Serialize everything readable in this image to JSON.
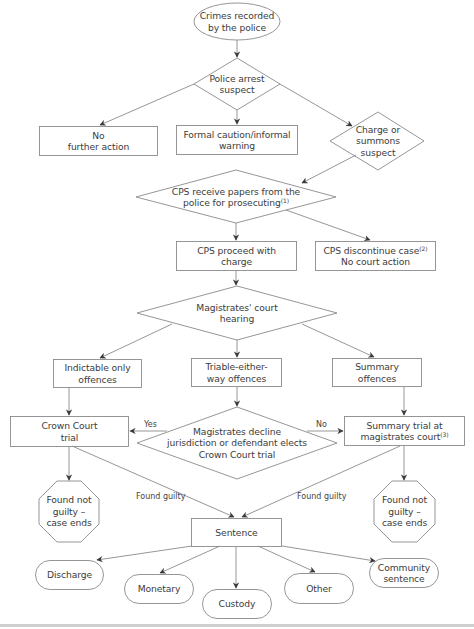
{
  "diagram": {
    "type": "flowchart",
    "stroke_color": "#8a8a8a",
    "arrow_color": "#3a3a3a",
    "nodes": {
      "crimes_recorded": {
        "shape": "ellipse",
        "text": "Crimes recorded\nby the police"
      },
      "police_arrest": {
        "shape": "diamond",
        "text": "Police arrest\nsuspect"
      },
      "no_further_action": {
        "shape": "rectangle",
        "text": "No\nfurther action"
      },
      "formal_caution": {
        "shape": "rectangle",
        "text": "Formal caution/informal\nwarning"
      },
      "charge_or_summons": {
        "shape": "diamond",
        "text": "Charge or\nsummons\nsuspect"
      },
      "cps_receive": {
        "shape": "diamond",
        "text": "CPS receive papers from the\npolice for prosecuting",
        "footnote": "(1)"
      },
      "cps_proceed": {
        "shape": "rectangle",
        "text": "CPS proceed with\ncharge"
      },
      "cps_discontinue": {
        "shape": "rectangle",
        "text_line1": "CPS discontinue case",
        "footnote": "(2)",
        "text_line2": "No court action"
      },
      "magistrates_hearing": {
        "shape": "diamond",
        "text": "Magistrates' court\nhearing"
      },
      "indictable_only": {
        "shape": "rectangle",
        "text": "Indictable only\noffences"
      },
      "triable_either_way": {
        "shape": "rectangle",
        "text": "Triable-either-\nway offences"
      },
      "summary_offences": {
        "shape": "rectangle",
        "text": "Summary\noffences"
      },
      "crown_court_trial": {
        "shape": "rectangle",
        "text": "Crown Court\ntrial"
      },
      "magistrates_decline": {
        "shape": "diamond",
        "text": "Magistrates decline\njurisdiction or defendant elects\nCrown Court trial"
      },
      "summary_trial": {
        "shape": "rectangle",
        "text_line1": "Summary trial at",
        "text_line2": "magistrates court",
        "footnote": "(3)"
      },
      "not_guilty_left": {
        "shape": "octagon",
        "text": "Found not\nguilty –\ncase ends"
      },
      "not_guilty_right": {
        "shape": "octagon",
        "text": "Found not\nguilty –\ncase ends"
      },
      "sentence": {
        "shape": "rectangle",
        "text": "Sentence"
      },
      "discharge": {
        "shape": "rounded",
        "text": "Discharge"
      },
      "monetary": {
        "shape": "rounded",
        "text": "Monetary"
      },
      "custody": {
        "shape": "rounded",
        "text": "Custody"
      },
      "other": {
        "shape": "rounded",
        "text": "Other"
      },
      "community_sentence": {
        "shape": "rounded",
        "text": "Community\nsentence"
      }
    },
    "edge_labels": {
      "yes": "Yes",
      "no": "No",
      "found_guilty_left": "Found guilty",
      "found_guilty_right": "Found guilty"
    },
    "edges": [
      [
        "crimes_recorded",
        "police_arrest"
      ],
      [
        "police_arrest",
        "no_further_action"
      ],
      [
        "police_arrest",
        "formal_caution"
      ],
      [
        "police_arrest",
        "charge_or_summons"
      ],
      [
        "charge_or_summons",
        "cps_receive"
      ],
      [
        "cps_receive",
        "cps_proceed"
      ],
      [
        "cps_receive",
        "cps_discontinue"
      ],
      [
        "cps_proceed",
        "magistrates_hearing"
      ],
      [
        "magistrates_hearing",
        "indictable_only"
      ],
      [
        "magistrates_hearing",
        "triable_either_way"
      ],
      [
        "magistrates_hearing",
        "summary_offences"
      ],
      [
        "indictable_only",
        "crown_court_trial"
      ],
      [
        "triable_either_way",
        "magistrates_decline"
      ],
      [
        "summary_offences",
        "summary_trial"
      ],
      [
        "magistrates_decline",
        "crown_court_trial",
        "Yes"
      ],
      [
        "magistrates_decline",
        "summary_trial",
        "No"
      ],
      [
        "crown_court_trial",
        "not_guilty_left"
      ],
      [
        "summary_trial",
        "not_guilty_right"
      ],
      [
        "crown_court_trial",
        "sentence",
        "Found guilty"
      ],
      [
        "summary_trial",
        "sentence",
        "Found guilty"
      ],
      [
        "sentence",
        "discharge"
      ],
      [
        "sentence",
        "monetary"
      ],
      [
        "sentence",
        "custody"
      ],
      [
        "sentence",
        "other"
      ],
      [
        "sentence",
        "community_sentence"
      ]
    ]
  }
}
